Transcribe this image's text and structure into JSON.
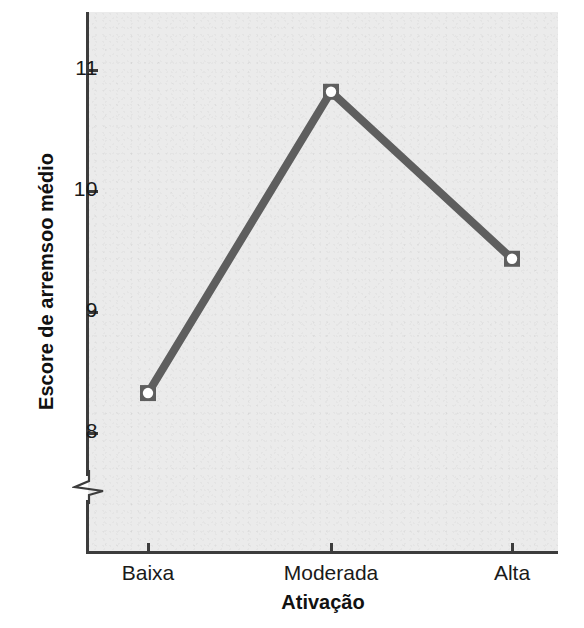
{
  "figure": {
    "background_color": "#ffffff",
    "panel_color": "#ebebeb",
    "axis_color": "#3c3c3c",
    "series_color": "#5e5e5e",
    "marker_fill": "#ffffff"
  },
  "chart_data": {
    "type": "line",
    "title": "",
    "subtitle": "",
    "xlabel": "Ativação",
    "ylabel": "Escore de arremsoo médio",
    "categories": [
      "Baixa",
      "Moderada",
      "Alta"
    ],
    "values": [
      8.33,
      10.82,
      9.44
    ],
    "series": [
      {
        "name": "Escore de arremsoo médio",
        "values": [
          8.33,
          10.82,
          9.44
        ]
      }
    ],
    "ylim": [
      7.45,
      11.35
    ],
    "yticks": [
      8,
      9,
      10,
      11
    ],
    "ytick_labels": [
      "8",
      "9",
      "10",
      "11"
    ],
    "xticks": [
      "Baixa",
      "Moderada",
      "Alta"
    ],
    "grid": false,
    "legend": "none",
    "axis_break": true,
    "axis_break_axis": "y",
    "marker": "square-with-open-circle",
    "line_width_px": 8,
    "annotations": []
  },
  "axis": {
    "y_label": "Escore de arremsoo médio",
    "x_label": "Ativação",
    "y_ticks": [
      {
        "label": "11",
        "value": 11
      },
      {
        "label": "10",
        "value": 10
      },
      {
        "label": "9",
        "value": 9
      },
      {
        "label": "8",
        "value": 8
      }
    ],
    "x_ticks": [
      {
        "label": "Baixa"
      },
      {
        "label": "Moderada"
      },
      {
        "label": "Alta"
      }
    ],
    "break_icon": "axis-break-icon"
  },
  "points": [
    {
      "category": "Baixa",
      "value": "8.33"
    },
    {
      "category": "Moderada",
      "value": "10.82"
    },
    {
      "category": "Alta",
      "value": "9.44"
    }
  ]
}
